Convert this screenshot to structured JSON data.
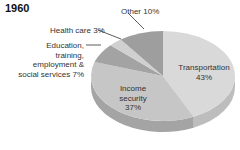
{
  "chart_data": {
    "type": "pie",
    "title": "1960",
    "style": "3d",
    "slices": [
      {
        "label": "Transportation",
        "value": 43,
        "color": "#d9d9d9",
        "side": "#bdbdbd"
      },
      {
        "label": "Income security",
        "value": 37,
        "color": "#c6c6c6",
        "side": "#a4a4a4"
      },
      {
        "label": "Education, training, employment & social services",
        "value": 7,
        "color": "#a3a3a3",
        "side": "#868686"
      },
      {
        "label": "Health care",
        "value": 3,
        "color": "#d0d0d0",
        "side": "#b2b2b2"
      },
      {
        "label": "Other",
        "value": 10,
        "color": "#9e9e9e",
        "side": "#808080"
      }
    ],
    "labels": {
      "transportation": [
        "Transportation",
        "43%"
      ],
      "income": [
        "Income",
        "security",
        "37%"
      ],
      "education": [
        "Education,",
        "training,",
        "employment &",
        "social services 7%"
      ],
      "health": "Health care 3%",
      "other": "Other 10%"
    }
  }
}
